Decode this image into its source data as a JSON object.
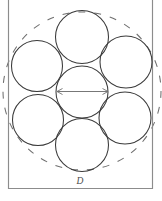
{
  "figure": {
    "name": "seven-circle-hexagonal-packing",
    "width": 162,
    "height": 201,
    "background_color": "#ffffff",
    "dimension_label": "D",
    "dimension_label_x": 80,
    "dimension_label_y": 184
  },
  "chart_data": {
    "type": "diagram",
    "title": "",
    "subtitle": "",
    "xlabel": "",
    "ylabel": "",
    "annotations": [
      {
        "text": "D",
        "x": 80,
        "y": 184,
        "style": "italic-serif",
        "describes": "enclosing-duct-width"
      }
    ],
    "legend": [],
    "grid": false,
    "shapes": {
      "enclosure": {
        "name": "duct-rectangle",
        "type": "open-top-rectangle",
        "left": 8.5,
        "right": 152.5,
        "bottom": 188.5,
        "top": 0,
        "stroke": "#8c8c8c",
        "stroke_width": 1.15
      },
      "envelope": {
        "name": "circumscribing-circle",
        "type": "circle",
        "cx": 82,
        "cy": 91,
        "r": 79,
        "dashed": true,
        "stroke": "#6f6f6f"
      },
      "packed_circles": [
        {
          "id": "center",
          "cx": 82,
          "cy": 92,
          "r": 26
        },
        {
          "id": "top",
          "cx": 82,
          "cy": 37,
          "r": 26.5
        },
        {
          "id": "upper-left",
          "cx": 37,
          "cy": 66,
          "r": 25.5
        },
        {
          "id": "upper-right",
          "cx": 126,
          "cy": 62,
          "r": 26
        },
        {
          "id": "lower-left",
          "cx": 38,
          "cy": 120,
          "r": 25.5
        },
        {
          "id": "lower-right",
          "cx": 125,
          "cy": 118,
          "r": 26
        },
        {
          "id": "bottom",
          "cx": 82,
          "cy": 145,
          "r": 26.5
        }
      ],
      "dimension_line": {
        "name": "center-circle-diameter",
        "type": "double-arrow-line",
        "x1": 57,
        "x2": 108,
        "y": 91.5,
        "stroke": "#707070"
      }
    },
    "counts": {
      "packed_circles": 7,
      "ring_circles": 6,
      "center_circles": 1
    }
  }
}
